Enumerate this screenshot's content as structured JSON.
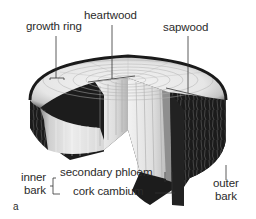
{
  "diagram": {
    "panel_letter": "a",
    "labels": {
      "growth_ring": "growth ring",
      "heartwood": "heartwood",
      "sapwood": "sapwood",
      "inner_bark_line1": "inner",
      "inner_bark_line2": "bark",
      "secondary_phloem": "secondary phloem",
      "cork_cambium": "cork cambium",
      "outer_bark_line1": "outer",
      "outer_bark_line2": "bark"
    },
    "colors": {
      "background": "#ffffff",
      "label_text": "#2b2b2b",
      "leader_line": "#333333",
      "bark_dark": "#1a1a1a",
      "wood_light": "#e8e8e8",
      "wood_mid": "#c8c8c8"
    }
  }
}
